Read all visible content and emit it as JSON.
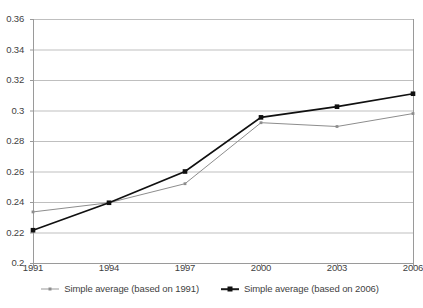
{
  "chart_data": {
    "type": "line",
    "title": "",
    "subtitle": "",
    "xlabel": "",
    "ylabel": "",
    "categories": [
      "1991",
      "1994",
      "1997",
      "2000",
      "2003",
      "2006"
    ],
    "x": [
      1991,
      1994,
      1997,
      2000,
      2003,
      2006
    ],
    "xlim": [
      1991,
      2006
    ],
    "ylim": [
      0.2,
      0.36
    ],
    "ytick_labels": [
      "0.2",
      "0.22",
      "0.24",
      "0.26",
      "0.28",
      "0.3",
      "0.32",
      "0.34",
      "0.36"
    ],
    "ytick_values": [
      0.2,
      0.22,
      0.24,
      0.26,
      0.28,
      0.3,
      0.32,
      0.34,
      0.36
    ],
    "grid": "horizontal",
    "legend_position": "bottom",
    "series": [
      {
        "name": "Simple average (based on 1991)",
        "color": "#8d8d8d",
        "marker": "small-square",
        "values": [
          0.2335,
          0.2395,
          0.252,
          0.292,
          0.2895,
          0.298
        ]
      },
      {
        "name": "Simple average (based on 2006)",
        "color": "#101010",
        "marker": "square",
        "values": [
          0.2215,
          0.2395,
          0.26,
          0.2955,
          0.3025,
          0.311
        ]
      }
    ]
  },
  "axes": {
    "y_ticks": [
      {
        "label": "0.36",
        "value": 0.36
      },
      {
        "label": "0.34",
        "value": 0.34
      },
      {
        "label": "0.32",
        "value": 0.32
      },
      {
        "label": "0.3",
        "value": 0.3
      },
      {
        "label": "0.28",
        "value": 0.28
      },
      {
        "label": "0.26",
        "value": 0.26
      },
      {
        "label": "0.24",
        "value": 0.24
      },
      {
        "label": "0.22",
        "value": 0.22
      },
      {
        "label": "0.2",
        "value": 0.2
      }
    ],
    "x_ticks": [
      {
        "label": "1991",
        "value": 1991
      },
      {
        "label": "1994",
        "value": 1994
      },
      {
        "label": "1997",
        "value": 1997
      },
      {
        "label": "2000",
        "value": 2000
      },
      {
        "label": "2003",
        "value": 2003
      },
      {
        "label": "2006",
        "value": 2006
      }
    ]
  },
  "legend": {
    "items": [
      {
        "label": "Simple average (based on 1991)"
      },
      {
        "label": "Simple average (based on 2006)"
      }
    ]
  },
  "colors": {
    "series_1991": "#8d8d8d",
    "series_2006": "#101010",
    "gridline": "#bfbfbf",
    "axis": "#9a9a9a",
    "text": "#3f3f3f",
    "plot_background": "#ffffff"
  }
}
